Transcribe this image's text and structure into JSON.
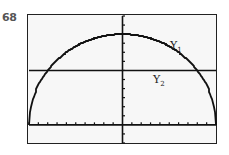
{
  "problem_number": "68",
  "labels": {
    "y1": "Y",
    "y1_sub": "1",
    "y2": "Y",
    "y2_sub": "2"
  },
  "chart_data": {
    "type": "line",
    "title": "",
    "xlabel": "",
    "ylabel": "",
    "xlim": [
      -10,
      10
    ],
    "ylim": [
      -2,
      12
    ],
    "xscale": 1,
    "yscale": 1,
    "grid": false,
    "series": [
      {
        "name": "Y1",
        "description": "upper semicircle y = sqrt(100 - x^2)",
        "x": [
          -10,
          -9,
          -8,
          -7,
          -6,
          -5,
          -4,
          -3,
          -2,
          -1,
          0,
          1,
          2,
          3,
          4,
          5,
          6,
          7,
          8,
          9,
          10
        ],
        "y": [
          0,
          4.36,
          6,
          7.14,
          8,
          8.66,
          9.17,
          9.54,
          9.8,
          9.95,
          10,
          9.95,
          9.8,
          9.54,
          9.17,
          8.66,
          8,
          7.14,
          6,
          4.36,
          0
        ]
      },
      {
        "name": "Y2",
        "description": "horizontal line y = 6",
        "x": [
          -10,
          10
        ],
        "y": [
          6,
          6
        ]
      }
    ],
    "intersections": [
      [
        -8,
        6
      ],
      [
        8,
        6
      ]
    ]
  }
}
